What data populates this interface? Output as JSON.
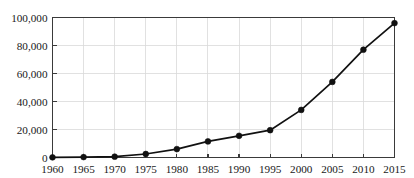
{
  "chart_data": {
    "type": "line",
    "title": "",
    "subtitle": "",
    "xlabel": "",
    "ylabel": "",
    "x": [
      1960,
      1965,
      1970,
      1975,
      1980,
      1985,
      1990,
      1995,
      2000,
      2005,
      2010,
      2015
    ],
    "categories": [
      "1960",
      "1965",
      "1970",
      "1975",
      "1980",
      "1985",
      "1990",
      "1995",
      "2000",
      "2005",
      "2010",
      "2015"
    ],
    "values": [
      100,
      300,
      600,
      2500,
      6000,
      11500,
      15500,
      19500,
      34000,
      54000,
      77000,
      96000
    ],
    "series": [
      {
        "name": "",
        "values": [
          100,
          300,
          600,
          2500,
          6000,
          11500,
          15500,
          19500,
          34000,
          54000,
          77000,
          96000
        ]
      }
    ],
    "xlim": [
      1960,
      2015
    ],
    "ylim": [
      0,
      100000
    ],
    "xticks": [
      1960,
      1965,
      1970,
      1975,
      1980,
      1985,
      1990,
      1995,
      2000,
      2005,
      2010,
      2015
    ],
    "xtick_labels": [
      "1960",
      "1965",
      "1970",
      "1975",
      "1980",
      "1985",
      "1990",
      "1995",
      "2000",
      "2005",
      "2010",
      "2015"
    ],
    "yticks": [
      0,
      20000,
      40000,
      60000,
      80000,
      100000
    ],
    "ytick_labels": [
      "0",
      "20,000",
      "40,000",
      "60,000",
      "80,000",
      "100,000"
    ],
    "grid": true,
    "grid_axis": "both",
    "legend": false,
    "legend_position": "none",
    "marker": "circle",
    "annotations": [],
    "colors": {
      "line": "#111111",
      "marker": "#111111",
      "grid": "#d9d9d9",
      "axis": "#3a3a3a",
      "background": "#ffffff",
      "text": "#1a1a1a"
    }
  }
}
